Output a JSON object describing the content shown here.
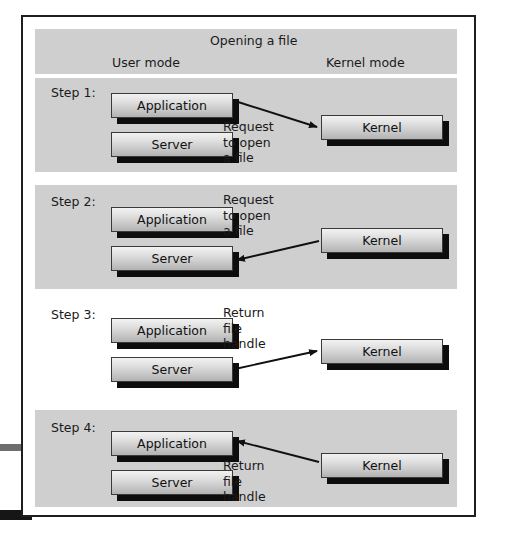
{
  "figure": {
    "title": "Opening a file",
    "columns": {
      "user_mode": "User mode",
      "kernel_mode": "Kernel mode"
    },
    "colors": {
      "band": "#cfcfcf",
      "frame": "#1e1e1e",
      "box_shadow": "#0d0d0d",
      "text": "#1a1a1a"
    },
    "steps": [
      {
        "label": "Step 1:",
        "banded": true,
        "boxes": [
          {
            "name": "Application",
            "side": "user"
          },
          {
            "name": "Server",
            "side": "user"
          },
          {
            "name": "Kernel",
            "side": "kernel"
          }
        ],
        "arrow": {
          "from": "Application",
          "to": "Kernel",
          "direction": "user-to-kernel",
          "caption": [
            "Request",
            "to open",
            "a file"
          ]
        }
      },
      {
        "label": "Step 2:",
        "banded": true,
        "boxes": [
          {
            "name": "Application",
            "side": "user"
          },
          {
            "name": "Server",
            "side": "user"
          },
          {
            "name": "Kernel",
            "side": "kernel"
          }
        ],
        "arrow": {
          "from": "Kernel",
          "to": "Server",
          "direction": "kernel-to-user",
          "caption": [
            "Request",
            "to open",
            "a file"
          ]
        }
      },
      {
        "label": "Step 3:",
        "banded": false,
        "boxes": [
          {
            "name": "Application",
            "side": "user"
          },
          {
            "name": "Server",
            "side": "user"
          },
          {
            "name": "Kernel",
            "side": "kernel"
          }
        ],
        "arrow": {
          "from": "Server",
          "to": "Kernel",
          "direction": "user-to-kernel",
          "caption": [
            "Return",
            "file",
            "handle"
          ]
        }
      },
      {
        "label": "Step 4:",
        "banded": true,
        "boxes": [
          {
            "name": "Application",
            "side": "user"
          },
          {
            "name": "Server",
            "side": "user"
          },
          {
            "name": "Kernel",
            "side": "kernel"
          }
        ],
        "arrow": {
          "from": "Kernel",
          "to": "Application",
          "direction": "kernel-to-user",
          "caption": [
            "Return",
            "file",
            "handle"
          ]
        }
      }
    ]
  }
}
